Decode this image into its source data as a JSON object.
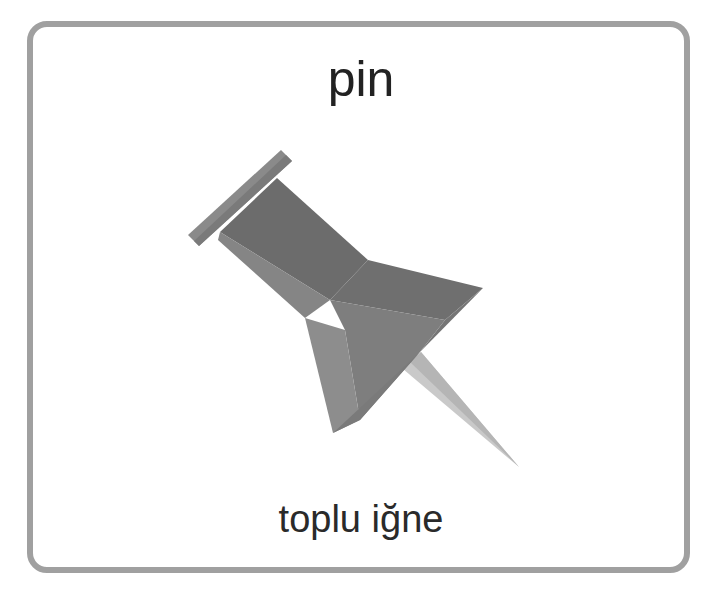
{
  "card": {
    "title": "pin",
    "subtitle": "toplu iğne",
    "image": "push-pin-icon"
  },
  "colors": {
    "border": "#a0a0a0",
    "pin_dark": "#6b6b6b",
    "pin_mid": "#7b7b7b",
    "pin_light": "#8e8e8e",
    "needle": "#c8c8c8"
  }
}
